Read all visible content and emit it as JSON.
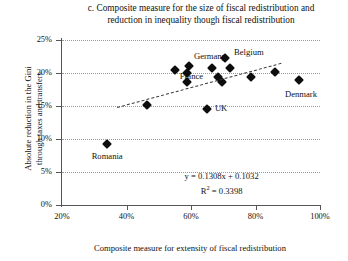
{
  "chart_data": {
    "type": "scatter",
    "title": "c. Composite measure for the size of fiscal redistribution and reduction in inequality though fiscal redistribution",
    "title_line1": "c. Composite measure for the size of fiscal redistribution and",
    "title_line2": "reduction in inequality though fiscal redistribution",
    "xlabel": "Composite measure for extensity of fiscal redistribution",
    "ylabel": "Absolute reduction in the Gini through taxes and transfers",
    "ylabel_line1": "Absolute reduction in the Gini",
    "ylabel_line2": "through taxes and transfers",
    "xlim": [
      20,
      100
    ],
    "ylim": [
      0,
      25
    ],
    "xticks": [
      20,
      40,
      60,
      80,
      100
    ],
    "xticklabels": [
      "20%",
      "40%",
      "60%",
      "80%",
      "100%"
    ],
    "yticks": [
      0,
      5,
      10,
      15,
      20,
      25
    ],
    "yticklabels": [
      "0%",
      "5%",
      "10%",
      "15%",
      "20%",
      "25%"
    ],
    "grid": "horizontal-dotted",
    "legend": "none",
    "marker": "filled-diamond",
    "marker_color": "#0d0d0d",
    "points": [
      {
        "x": 34.0,
        "y": 9.3,
        "label": "Romania",
        "label_dx": 0,
        "label_dy": 13
      },
      {
        "x": 46.5,
        "y": 15.2,
        "label": "",
        "label_dx": 0,
        "label_dy": 0
      },
      {
        "x": 55.0,
        "y": 20.4,
        "label": "",
        "label_dx": 0,
        "label_dy": 0
      },
      {
        "x": 58.8,
        "y": 20.0,
        "label": "",
        "label_dx": 0,
        "label_dy": 0
      },
      {
        "x": 58.8,
        "y": 18.7,
        "label": "",
        "label_dx": 0,
        "label_dy": 0
      },
      {
        "x": 59.5,
        "y": 21.0,
        "label": "",
        "label_dx": 0,
        "label_dy": 0
      },
      {
        "x": 65.0,
        "y": 14.6,
        "label": "UK",
        "label_dx": 14,
        "label_dy": 0
      },
      {
        "x": 66.5,
        "y": 20.8,
        "label": "Germany",
        "label_dx": -2,
        "label_dy": -11
      },
      {
        "x": 68.5,
        "y": 19.4,
        "label": "France",
        "label_dx": -27,
        "label_dy": 0
      },
      {
        "x": 69.5,
        "y": 18.7,
        "label": "",
        "label_dx": 0,
        "label_dy": 0
      },
      {
        "x": 70.5,
        "y": 22.2,
        "label": "Belgium",
        "label_dx": 24,
        "label_dy": -6
      },
      {
        "x": 72.0,
        "y": 20.7,
        "label": "",
        "label_dx": 0,
        "label_dy": 0
      },
      {
        "x": 78.5,
        "y": 19.4,
        "label": "",
        "label_dx": 0,
        "label_dy": 0
      },
      {
        "x": 86.0,
        "y": 20.2,
        "label": "",
        "label_dx": 0,
        "label_dy": 0
      },
      {
        "x": 93.5,
        "y": 18.9,
        "label": "Denmark",
        "label_dx": 2,
        "label_dy": 14
      }
    ],
    "trendline": {
      "style": "dashed",
      "x_start": 37.0,
      "y_start": 14.9,
      "x_end": 88.0,
      "y_end": 21.6
    },
    "annotations": {
      "equation": "y = 0.1308x + 0.1032",
      "r_squared_prefix": "R",
      "r_squared_exponent": "2",
      "r_squared_value": " = 0.3398"
    }
  }
}
